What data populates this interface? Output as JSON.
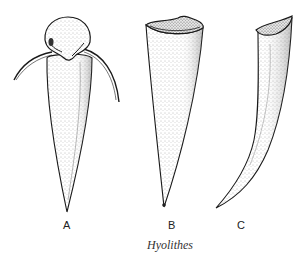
{
  "figure": {
    "caption": "Hyolithes",
    "specimens": [
      {
        "label": "A",
        "description": "conical shell with operculum and curved helens"
      },
      {
        "label": "B",
        "description": "straight conical shell, aperture view"
      },
      {
        "label": "C",
        "description": "curved conical shell, lateral view"
      }
    ],
    "colors": {
      "ink": "#1a1a1a",
      "stipple": "#8a8a8a",
      "background": "#ffffff"
    }
  }
}
